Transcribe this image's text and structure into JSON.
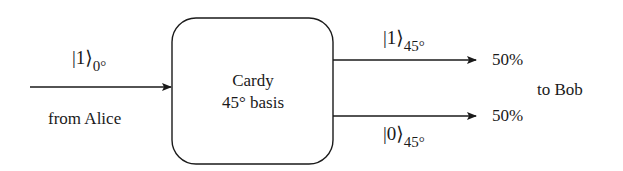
{
  "diagram": {
    "input": {
      "state_ket": "|1⟩",
      "state_subscript": "0°",
      "source_label": "from Alice"
    },
    "box": {
      "line1": "Cardy",
      "line2": "45° basis"
    },
    "outputs": [
      {
        "state_ket": "|1⟩",
        "state_subscript": "45°",
        "probability": "50%"
      },
      {
        "state_ket": "|0⟩",
        "state_subscript": "45°",
        "probability": "50%"
      }
    ],
    "destination_label": "to Bob"
  },
  "colors": {
    "stroke": "#1a1a1a",
    "background": "#ffffff"
  }
}
